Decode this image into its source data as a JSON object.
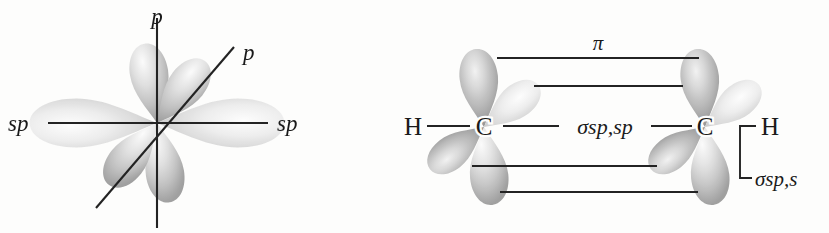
{
  "figure": {
    "background_color": "#fdfdfc",
    "ink_color": "#232323"
  },
  "left_diagram": {
    "name": "sp-hybridized carbon orbital set",
    "labels": {
      "p_vertical": "p",
      "p_diagonal": "p",
      "sp_left": "sp",
      "sp_right": "sp"
    },
    "axes": [
      {
        "name": "vertical-p-axis",
        "label": "p"
      },
      {
        "name": "horizontal-sp-axis",
        "label": "sp"
      },
      {
        "name": "diagonal-p-axis",
        "label": "p"
      }
    ],
    "lobe_count": 6
  },
  "right_diagram": {
    "name": "acetylene bonding diagram",
    "labels": {
      "pi_bond": "π",
      "sigma_sp_sp": "σsp,sp",
      "sigma_sp_s": "σsp,s",
      "carbon_left": "C",
      "carbon_right": "C",
      "hydrogen_left": "H",
      "hydrogen_right": "H"
    },
    "atoms": [
      {
        "symbol": "H",
        "name": "hydrogen-left"
      },
      {
        "symbol": "C",
        "name": "carbon-left"
      },
      {
        "symbol": "C",
        "name": "carbon-right"
      },
      {
        "symbol": "H",
        "name": "hydrogen-right"
      }
    ],
    "bonds": [
      {
        "name": "pi-bond-upper",
        "label": "π"
      },
      {
        "name": "pi-bond-upper-inner",
        "label": ""
      },
      {
        "name": "sigma-sp-sp-bond",
        "label": "σsp,sp"
      },
      {
        "name": "pi-bond-lower-inner",
        "label": ""
      },
      {
        "name": "pi-bond-lower",
        "label": ""
      },
      {
        "name": "sigma-sp-s-bond",
        "label": "σsp,s"
      }
    ]
  }
}
